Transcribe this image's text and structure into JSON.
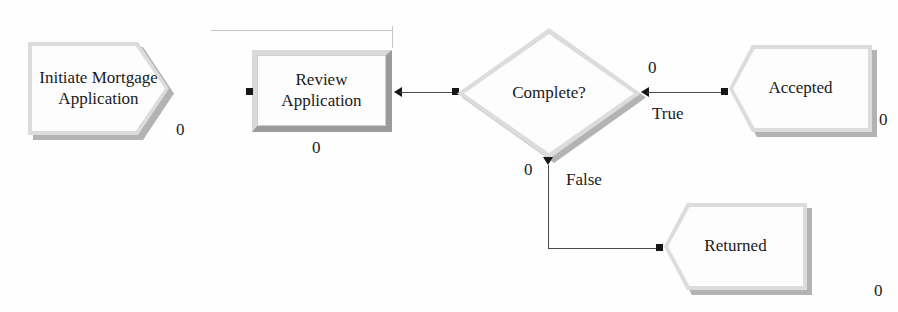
{
  "diagram": {
    "background_color": "#fefefe",
    "line_color": "#4a4a4a",
    "shadow_color": "#b3b3b3",
    "bevel_light_color": "#dcdcdc",
    "face_color": "#fdfdfd",
    "text_color": "#1a1a1a",
    "top_clipped_text": "",
    "nodes": [
      {
        "id": "initiate",
        "label_line1": "Initiate Mortgage",
        "label_line2": "Application",
        "shape": "pentagon-right",
        "counter": "0"
      },
      {
        "id": "review",
        "label_line1": "Review",
        "label_line2": "Application",
        "shape": "rectangle",
        "counter": "0"
      },
      {
        "id": "complete",
        "label_line1": "Complete?",
        "label_line2": "",
        "shape": "diamond",
        "counter_true": "0",
        "counter_false": "0"
      },
      {
        "id": "accepted",
        "label_line1": "Accepted",
        "label_line2": "",
        "shape": "pentagon-left-notch",
        "counter": "0"
      },
      {
        "id": "returned",
        "label_line1": "Returned",
        "label_line2": "",
        "shape": "pentagon-left-notch",
        "counter": "0"
      }
    ],
    "edges": [
      {
        "id": "review-to-complete",
        "label": ""
      },
      {
        "id": "complete-true-accepted",
        "label": "True"
      },
      {
        "id": "complete-false-returned",
        "label": "False"
      }
    ]
  }
}
